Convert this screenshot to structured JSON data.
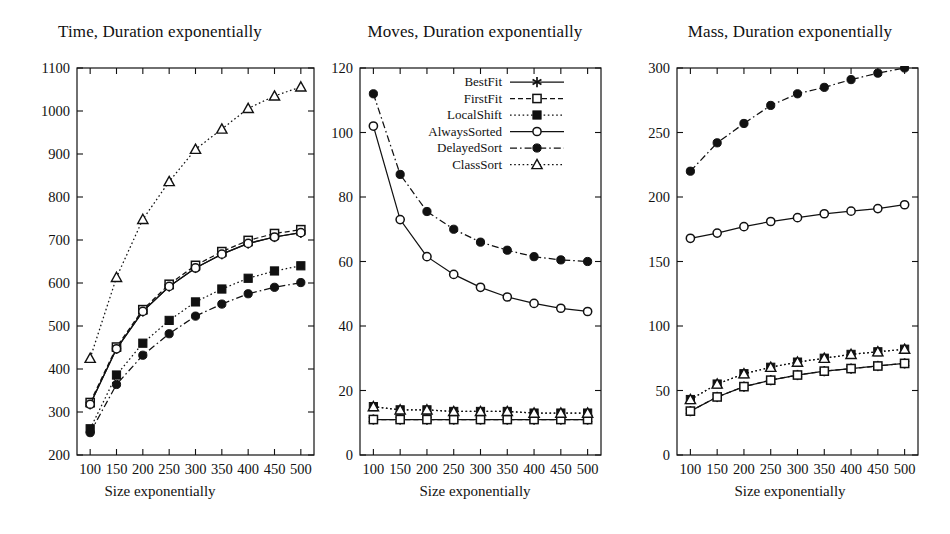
{
  "figure": {
    "xlabel": "Size exponentially",
    "x_ticks": [
      "100",
      "150",
      "200",
      "250",
      "300",
      "350",
      "400",
      "450",
      "500"
    ],
    "series_names": [
      "BestFit",
      "FirstFit",
      "LocalShift",
      "AlwaysSorted",
      "DelayedSort",
      "ClassSort"
    ],
    "colors": {
      "ink": "#111111",
      "background": "#ffffff",
      "axis": "#222222"
    }
  },
  "legend": {
    "position": "top-right-of-middle-panel",
    "entries": [
      {
        "label": "BestFit",
        "marker": "asterisk",
        "line": "solid"
      },
      {
        "label": "FirstFit",
        "marker": "open-square",
        "line": "dashed"
      },
      {
        "label": "LocalShift",
        "marker": "filled-square",
        "line": "dotted"
      },
      {
        "label": "AlwaysSorted",
        "marker": "open-circle",
        "line": "solid"
      },
      {
        "label": "DelayedSort",
        "marker": "filled-circle",
        "line": "dashdot"
      },
      {
        "label": "ClassSort",
        "marker": "open-triangle",
        "line": "dotted"
      }
    ]
  },
  "chart_data": [
    {
      "type": "line",
      "title": "Time, Duration exponentially",
      "xlabel": "Size exponentially",
      "ylabel": "",
      "x": [
        100,
        150,
        200,
        250,
        300,
        350,
        400,
        450,
        500
      ],
      "xlim": [
        75,
        525
      ],
      "ylim": [
        200,
        1100
      ],
      "ytick_labels": [
        "200",
        "300",
        "400",
        "500",
        "600",
        "700",
        "800",
        "900",
        "1000",
        "1100"
      ],
      "yticks": [
        200,
        300,
        400,
        500,
        600,
        700,
        800,
        900,
        1000,
        1100
      ],
      "grid": false,
      "series": [
        {
          "name": "BestFit",
          "marker": "asterisk",
          "line": "solid",
          "values": [
            318,
            447,
            534,
            592,
            635,
            667,
            692,
            707,
            717
          ]
        },
        {
          "name": "FirstFit",
          "marker": "open-square",
          "line": "dashed",
          "values": [
            322,
            451,
            538,
            597,
            641,
            673,
            699,
            715,
            724
          ]
        },
        {
          "name": "LocalShift",
          "marker": "filled-square",
          "line": "dotted",
          "values": [
            261,
            386,
            460,
            513,
            556,
            586,
            611,
            628,
            640
          ]
        },
        {
          "name": "AlwaysSorted",
          "marker": "open-circle",
          "line": "solid",
          "values": [
            318,
            447,
            534,
            592,
            635,
            667,
            692,
            707,
            717
          ]
        },
        {
          "name": "DelayedSort",
          "marker": "filled-circle",
          "line": "dashdot",
          "values": [
            252,
            364,
            432,
            482,
            523,
            551,
            575,
            590,
            601
          ]
        },
        {
          "name": "ClassSort",
          "marker": "open-triangle",
          "line": "dotted",
          "values": [
            425,
            613,
            748,
            836,
            911,
            958,
            1006,
            1035,
            1056
          ]
        }
      ]
    },
    {
      "type": "line",
      "title": "Moves, Duration exponentially",
      "xlabel": "Size exponentially",
      "ylabel": "",
      "x": [
        100,
        150,
        200,
        250,
        300,
        350,
        400,
        450,
        500
      ],
      "xlim": [
        75,
        525
      ],
      "ylim": [
        0,
        120
      ],
      "ytick_labels": [
        "0",
        "20",
        "40",
        "60",
        "80",
        "100",
        "120"
      ],
      "yticks": [
        0,
        20,
        40,
        60,
        80,
        100,
        120
      ],
      "grid": false,
      "series": [
        {
          "name": "BestFit",
          "marker": "asterisk",
          "line": "solid",
          "values": [
            11,
            11,
            11,
            11,
            11,
            11,
            11,
            11,
            11
          ]
        },
        {
          "name": "FirstFit",
          "marker": "open-square",
          "line": "dashed",
          "values": [
            11,
            11,
            11,
            11,
            11,
            11,
            11,
            11,
            11
          ]
        },
        {
          "name": "LocalShift",
          "marker": "filled-square",
          "line": "dotted",
          "values": [
            15,
            14,
            14,
            13.5,
            13.5,
            13.5,
            13,
            13,
            13
          ]
        },
        {
          "name": "AlwaysSorted",
          "marker": "open-circle",
          "line": "solid",
          "values": [
            102,
            73,
            61.5,
            56,
            52,
            49,
            47,
            45.5,
            44.5
          ]
        },
        {
          "name": "DelayedSort",
          "marker": "filled-circle",
          "line": "dashdot",
          "values": [
            112,
            87,
            75.5,
            70,
            66,
            63.5,
            61.5,
            60.5,
            60
          ]
        },
        {
          "name": "ClassSort",
          "marker": "open-triangle",
          "line": "dotted",
          "values": [
            15,
            14,
            14,
            13.5,
            13.5,
            13.5,
            13,
            13,
            13
          ]
        }
      ]
    },
    {
      "type": "line",
      "title": "Mass, Duration exponentially",
      "xlabel": "Size exponentially",
      "ylabel": "",
      "x": [
        100,
        150,
        200,
        250,
        300,
        350,
        400,
        450,
        500
      ],
      "xlim": [
        75,
        525
      ],
      "ylim": [
        0,
        300
      ],
      "ytick_labels": [
        "0",
        "50",
        "100",
        "150",
        "200",
        "250",
        "300"
      ],
      "yticks": [
        0,
        50,
        100,
        150,
        200,
        250,
        300
      ],
      "grid": false,
      "series": [
        {
          "name": "BestFit",
          "marker": "asterisk",
          "line": "solid",
          "values": [
            34,
            45,
            53,
            58,
            62,
            65,
            67,
            69,
            71
          ]
        },
        {
          "name": "FirstFit",
          "marker": "open-square",
          "line": "dashed",
          "values": [
            34,
            45,
            53,
            58,
            62,
            65,
            67,
            69,
            71
          ]
        },
        {
          "name": "LocalShift",
          "marker": "filled-square",
          "line": "dotted",
          "values": [
            43,
            55,
            63,
            68,
            72,
            75,
            78,
            80,
            82
          ]
        },
        {
          "name": "AlwaysSorted",
          "marker": "open-circle",
          "line": "solid",
          "values": [
            168,
            172,
            177,
            181,
            184,
            187,
            189,
            191,
            194
          ]
        },
        {
          "name": "DelayedSort",
          "marker": "filled-circle",
          "line": "dashdot",
          "values": [
            220,
            242,
            257,
            271,
            280,
            285,
            291,
            296,
            300
          ]
        },
        {
          "name": "ClassSort",
          "marker": "open-triangle",
          "line": "dotted",
          "values": [
            43,
            55,
            63,
            68,
            72,
            75,
            78,
            80,
            82
          ]
        }
      ]
    }
  ]
}
